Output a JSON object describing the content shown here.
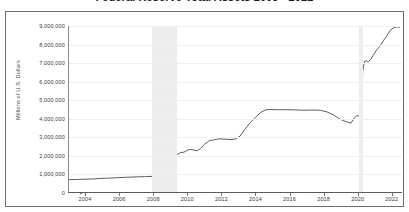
{
  "title": "Federal Reserve Total Assets 2003 - 2022",
  "axis": {
    "ylabel": "Millions of U.S. Dollars",
    "ytick_labels": [
      "9,000,000",
      "8,000,000",
      "7,000,000",
      "6,000,000",
      "5,000,000",
      "4,000,000",
      "3,000,000",
      "2,000,000",
      "1,000,000",
      "0"
    ],
    "xtick_labels": [
      "2004",
      "2006",
      "2008",
      "2010",
      "2012",
      "2014",
      "2016",
      "2018",
      "2020",
      "2022"
    ]
  },
  "colors": {
    "line": "#4c4c4c",
    "recession_band": "#ededed",
    "grid": "#f0f0f0",
    "frame": "#6f6f6f",
    "text": "#3d3d3d"
  },
  "chart_data": {
    "type": "line",
    "title": "Federal Reserve Total Assets 2003 - 2022",
    "xlabel": "",
    "ylabel": "Millions of U.S. Dollars",
    "xlim": [
      2003.0,
      2022.6
    ],
    "ylim": [
      0,
      9000000
    ],
    "yticks": [
      0,
      1000000,
      2000000,
      3000000,
      4000000,
      5000000,
      6000000,
      7000000,
      8000000,
      9000000
    ],
    "xticks": [
      2004,
      2006,
      2008,
      2010,
      2012,
      2014,
      2016,
      2018,
      2020,
      2022
    ],
    "grid": true,
    "legend": "none",
    "series": [
      {
        "name": "Federal Reserve Total Assets",
        "x": [
          2003.0,
          2003.5,
          2004.0,
          2004.5,
          2005.0,
          2005.5,
          2006.0,
          2006.5,
          2007.0,
          2007.5,
          2008.0,
          2008.3,
          2008.6,
          2008.75,
          2008.85,
          2008.95,
          2009.05,
          2009.15,
          2009.25,
          2009.35,
          2009.45,
          2009.6,
          2009.8,
          2010.0,
          2010.2,
          2010.4,
          2010.6,
          2010.8,
          2011.0,
          2011.3,
          2011.6,
          2011.9,
          2012.2,
          2012.5,
          2012.8,
          2013.1,
          2013.4,
          2013.7,
          2014.0,
          2014.3,
          2014.6,
          2014.9,
          2015.3,
          2015.8,
          2016.3,
          2016.8,
          2017.3,
          2017.8,
          2018.2,
          2018.6,
          2019.0,
          2019.3,
          2019.6,
          2019.8,
          2019.95,
          2020.05,
          2020.15,
          2020.22,
          2020.3,
          2020.4,
          2020.5,
          2020.6,
          2020.75,
          2020.9,
          2021.1,
          2021.3,
          2021.5,
          2021.7,
          2021.9,
          2022.1,
          2022.3,
          2022.45
        ],
        "y": [
          720000,
          730000,
          745000,
          760000,
          790000,
          805000,
          830000,
          850000,
          870000,
          880000,
          900000,
          905000,
          910000,
          2250000,
          2240000,
          1930000,
          2080000,
          1890000,
          2080000,
          2030000,
          2100000,
          2180000,
          2200000,
          2300000,
          2350000,
          2310000,
          2280000,
          2420000,
          2620000,
          2830000,
          2870000,
          2920000,
          2900000,
          2880000,
          2900000,
          3070000,
          3450000,
          3800000,
          4070000,
          4340000,
          4480000,
          4500000,
          4490000,
          4490000,
          4480000,
          4460000,
          4470000,
          4460000,
          4370000,
          4200000,
          3960000,
          3850000,
          3760000,
          4050000,
          4170000,
          4150000,
          4230000,
          5250000,
          6600000,
          7100000,
          7130000,
          7060000,
          7180000,
          7400000,
          7700000,
          7900000,
          8200000,
          8450000,
          8760000,
          8900000,
          8960000,
          8930000
        ]
      }
    ],
    "recession_bands": [
      {
        "name": "Great Recession",
        "start": 2007.92,
        "end": 2009.42
      },
      {
        "name": "COVID-19 Recession",
        "start": 2020.08,
        "end": 2020.33
      }
    ]
  }
}
